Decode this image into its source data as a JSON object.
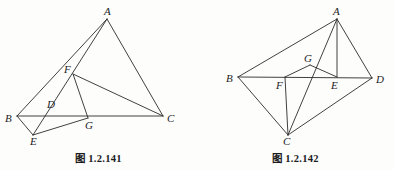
{
  "page": {
    "background_color": "#fdfdfc",
    "ink_color": "#2b2b2b",
    "width": 394,
    "height": 170
  },
  "figures": [
    {
      "id": "figure-left",
      "caption": "图 1.2.141",
      "description": "triangle ABC with cevians and interior points D, E, F, G",
      "vertices": [
        {
          "label": "A",
          "x": 107,
          "y": 19,
          "label_x": 104,
          "label_y": 6
        },
        {
          "label": "B",
          "x": 17,
          "y": 116,
          "label_x": 5,
          "label_y": 113
        },
        {
          "label": "C",
          "x": 163,
          "y": 116,
          "label_x": 167,
          "label_y": 113
        },
        {
          "label": "D",
          "x": 57,
          "y": 110,
          "label_x": 47,
          "label_y": 99
        },
        {
          "label": "E",
          "x": 33,
          "y": 135,
          "label_x": 30,
          "label_y": 136
        },
        {
          "label": "F",
          "x": 73,
          "y": 74,
          "label_x": 64,
          "label_y": 64
        },
        {
          "label": "G",
          "x": 88,
          "y": 118,
          "label_x": 85,
          "label_y": 120
        }
      ],
      "segments": [
        {
          "name": "A-B",
          "from": "A",
          "to": "B"
        },
        {
          "name": "A-C",
          "from": "A",
          "to": "C"
        },
        {
          "name": "A-E",
          "from": "A",
          "to": "E"
        },
        {
          "name": "B-C",
          "from": "B",
          "to": "C"
        },
        {
          "name": "B-E",
          "from": "B",
          "to": "E"
        },
        {
          "name": "E-G",
          "from": "E",
          "to": "G"
        },
        {
          "name": "G-F",
          "from": "G",
          "to": "F"
        },
        {
          "name": "F-C",
          "from": "F",
          "to": "C"
        }
      ]
    },
    {
      "id": "figure-right",
      "caption": "图 1.2.142",
      "description": "quadrilateral ABCD with diagonal BD and interior points E, F, G",
      "vertices": [
        {
          "label": "A",
          "x": 140,
          "y": 19,
          "label_x": 136,
          "label_y": 6
        },
        {
          "label": "B",
          "x": 41,
          "y": 77,
          "label_x": 29,
          "label_y": 73
        },
        {
          "label": "C",
          "x": 91,
          "y": 135,
          "label_x": 86,
          "label_y": 136
        },
        {
          "label": "D",
          "x": 175,
          "y": 78,
          "label_x": 179,
          "label_y": 74
        },
        {
          "label": "E",
          "x": 140,
          "y": 77,
          "label_x": 134,
          "label_y": 80
        },
        {
          "label": "F",
          "x": 88,
          "y": 77,
          "label_x": 79,
          "label_y": 80
        },
        {
          "label": "G",
          "x": 113,
          "y": 65,
          "label_x": 107,
          "label_y": 53
        }
      ],
      "segments": [
        {
          "name": "A-B",
          "from": "A",
          "to": "B"
        },
        {
          "name": "A-D",
          "from": "A",
          "to": "D"
        },
        {
          "name": "A-E",
          "from": "A",
          "to": "E"
        },
        {
          "name": "A-C",
          "from": "A",
          "to": "C"
        },
        {
          "name": "B-C",
          "from": "B",
          "to": "C"
        },
        {
          "name": "C-D",
          "from": "C",
          "to": "D"
        },
        {
          "name": "B-D",
          "from": "B",
          "to": "D"
        },
        {
          "name": "F-G",
          "from": "F",
          "to": "G"
        },
        {
          "name": "G-E",
          "from": "G",
          "to": "E"
        },
        {
          "name": "F-C",
          "from": "F",
          "to": "C"
        }
      ]
    }
  ]
}
